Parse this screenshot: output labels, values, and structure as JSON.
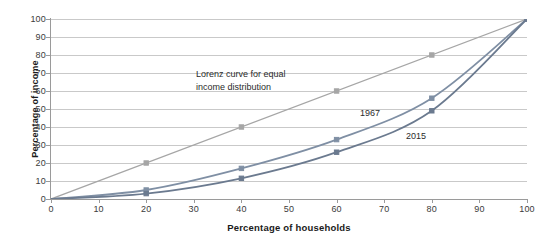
{
  "chart_data": {
    "type": "line",
    "title": "",
    "subtitle": "",
    "xlabel": "Percentage of households",
    "ylabel": "Percentage of income",
    "xlim": [
      0,
      100
    ],
    "ylim": [
      0,
      100
    ],
    "grid": true,
    "grid_axis": "y",
    "legend_position": "none",
    "x_ticks": [
      0,
      10,
      20,
      30,
      40,
      50,
      60,
      70,
      80,
      90,
      100
    ],
    "y_ticks": [
      0,
      10,
      20,
      30,
      40,
      50,
      60,
      70,
      80,
      90,
      100
    ],
    "x": [
      0,
      20,
      40,
      60,
      80,
      100
    ],
    "series": [
      {
        "name": "Lorenz curve for equal income distribution",
        "values": [
          0,
          20,
          40,
          60,
          80,
          100
        ],
        "color": "#a6a6a6",
        "marker": "square"
      },
      {
        "name": "1967",
        "values": [
          0,
          5,
          17,
          33,
          56,
          100
        ],
        "color": "#7f8fa4",
        "marker": "square"
      },
      {
        "name": "2015",
        "values": [
          0,
          3,
          11.5,
          26,
          49,
          100
        ],
        "color": "#6b7a8f",
        "marker": "square"
      }
    ],
    "annotations": [
      {
        "id": "equality",
        "text": "Lorenz curve for equal\nincome distribution",
        "x": 28,
        "y": 66
      },
      {
        "id": "curve_1967",
        "text": "1967",
        "x": 65,
        "y": 49
      },
      {
        "id": "curve_2015",
        "text": "2015",
        "x": 75,
        "y": 36
      }
    ]
  },
  "axes": {
    "x_title": "Percentage of households",
    "y_title": "Percentage of income",
    "x_tick_labels": [
      "0",
      "10",
      "20",
      "30",
      "40",
      "50",
      "60",
      "70",
      "80",
      "90",
      "100"
    ],
    "y_tick_labels": [
      "0",
      "10",
      "20",
      "30",
      "40",
      "50",
      "60",
      "70",
      "80",
      "90",
      "100"
    ]
  },
  "annotations": {
    "equality": "Lorenz curve for equal\nincome distribution",
    "curve_1967": "1967",
    "curve_2015": "2015"
  },
  "colors": {
    "equality_line": "#a6a6a6",
    "line_1967": "#7f8fa4",
    "line_2015": "#6b7a8f",
    "gridline": "#c9c9c9",
    "axis": "#9a9a9a",
    "text": "#1a1a1a",
    "background": "#ffffff"
  }
}
